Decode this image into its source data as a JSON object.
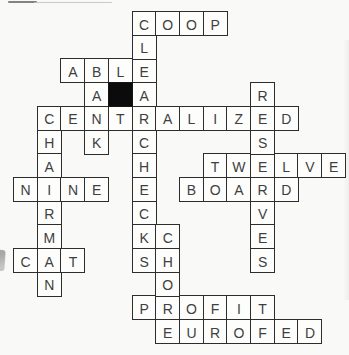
{
  "puzzle": {
    "type": "crossword-solution-grid",
    "rows": 14,
    "cols": 14,
    "across_answers": [
      {
        "answer": "COOP",
        "row": 0,
        "col": 5
      },
      {
        "answer": "ABLE",
        "row": 2,
        "col": 2
      },
      {
        "answer": "CENTRALIZED",
        "row": 4,
        "col": 1
      },
      {
        "answer": "TWELVE",
        "row": 6,
        "col": 8
      },
      {
        "answer": "NINE",
        "row": 7,
        "col": 0
      },
      {
        "answer": "BOARD",
        "row": 7,
        "col": 7
      },
      {
        "answer": "CAT",
        "row": 10,
        "col": 0
      },
      {
        "answer": "PROFIT",
        "row": 12,
        "col": 5
      },
      {
        "answer": "EUROFED",
        "row": 13,
        "col": 6
      }
    ],
    "down_answers": [
      {
        "answer": "CLEAR",
        "row": 0,
        "col": 5
      },
      {
        "answer": "BANK",
        "row": 2,
        "col": 3
      },
      {
        "answer": "RESERVES",
        "row": 3,
        "col": 10
      },
      {
        "answer": "CHAIRMAN",
        "row": 4,
        "col": 1
      },
      {
        "answer": "CHECKS",
        "row": 5,
        "col": 5
      },
      {
        "answer": "CHORE",
        "row": 9,
        "col": 6
      }
    ],
    "black_cells": [
      {
        "row": 3,
        "col": 4
      }
    ]
  },
  "colors": {
    "background": "#f9f9f8",
    "cell_background": "#fdfdfc",
    "grid_line": "#2d2d2d",
    "letter": "#3f3f3f",
    "black_cell": "#0b0b0b"
  }
}
